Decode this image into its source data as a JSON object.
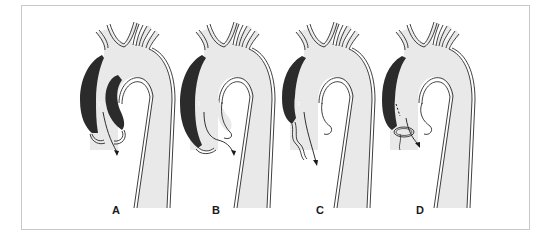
{
  "figure": {
    "colors": {
      "vessel_fill": "#e9e9e9",
      "vessel_wall": "#2a2a2a",
      "false_lumen": "#2b2b2b",
      "background": "#ffffff",
      "frame_border": "#c8c8c8"
    },
    "panels": [
      {
        "id": "A",
        "label": "A",
        "offset_x": 0
      },
      {
        "id": "B",
        "label": "B",
        "offset_x": 100
      },
      {
        "id": "C",
        "label": "C",
        "offset_x": 200
      },
      {
        "id": "D",
        "label": "D",
        "offset_x": 300
      }
    ]
  }
}
